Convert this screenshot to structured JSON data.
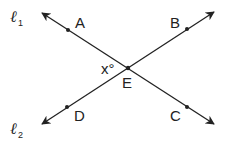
{
  "diagram": {
    "type": "intersecting-lines",
    "line_color": "#222222",
    "lines": [
      {
        "name": "l1",
        "label_main": "ℓ",
        "label_sub": "1"
      },
      {
        "name": "l2",
        "label_main": "ℓ",
        "label_sub": "2"
      }
    ],
    "points": {
      "A": "A",
      "B": "B",
      "C": "C",
      "D": "D",
      "E": "E"
    },
    "angle_label": "x°"
  }
}
